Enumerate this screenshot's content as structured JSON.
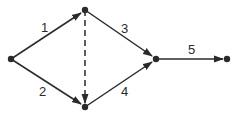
{
  "diagram": {
    "type": "directed-network",
    "colors": {
      "stroke": "#2a2a2a",
      "background": "#ffffff"
    },
    "nodes": [
      {
        "id": "A",
        "x": 11,
        "y": 59
      },
      {
        "id": "B",
        "x": 85,
        "y": 10
      },
      {
        "id": "C",
        "x": 85,
        "y": 107
      },
      {
        "id": "D",
        "x": 156,
        "y": 59
      },
      {
        "id": "E",
        "x": 227,
        "y": 59
      }
    ],
    "edges": [
      {
        "from": "A",
        "to": "B",
        "label": "1",
        "style": "solid"
      },
      {
        "from": "A",
        "to": "C",
        "label": "2",
        "style": "solid"
      },
      {
        "from": "B",
        "to": "D",
        "label": "3",
        "style": "solid"
      },
      {
        "from": "C",
        "to": "D",
        "label": "4",
        "style": "solid"
      },
      {
        "from": "D",
        "to": "E",
        "label": "5",
        "style": "solid"
      },
      {
        "from": "B",
        "to": "C",
        "label": "",
        "style": "dashed"
      }
    ],
    "labels": {
      "e1": "1",
      "e2": "2",
      "e3": "3",
      "e4": "4",
      "e5": "5"
    }
  }
}
